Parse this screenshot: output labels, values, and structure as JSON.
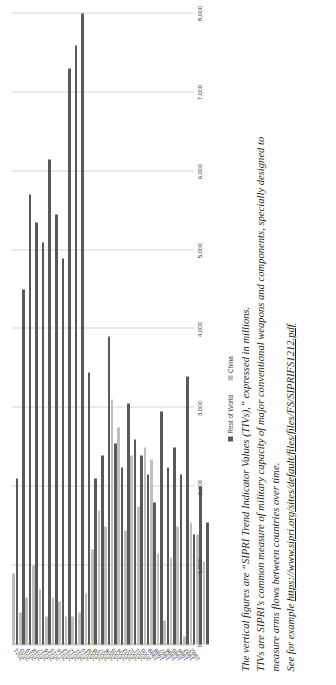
{
  "chart_data": {
    "type": "bar",
    "orientation": "horizontal",
    "title": "",
    "xlabel": "",
    "ylabel": "",
    "xlim": [
      0,
      8000
    ],
    "xticks": [
      "0",
      "1,000",
      "2,000",
      "3,000",
      "4,000",
      "5,000",
      "6,000",
      "7,000",
      "8,000"
    ],
    "xtick_values": [
      0,
      1000,
      2000,
      3000,
      4000,
      5000,
      6000,
      7000,
      8000
    ],
    "grid": true,
    "legend_position": "bottom-right",
    "categories": [
      "1992",
      "1993",
      "1994",
      "1995",
      "1996",
      "1997",
      "1998",
      "1999",
      "2000",
      "2001",
      "2002",
      "2003",
      "2004",
      "2005",
      "2006",
      "2007",
      "2008",
      "2009",
      "2010",
      "2011",
      "2012",
      "2013",
      "2014",
      "2015",
      "2016",
      "2017",
      "2018",
      "2019",
      "2020",
      "2021"
    ],
    "series": [
      {
        "name": "China",
        "color": "#bfbfbf",
        "values": [
          1050,
          1400,
          1550,
          100,
          1500,
          1100,
          300,
          1150,
          2350,
          2500,
          1750,
          2400,
          1450,
          2750,
          3100,
          1500,
          1700,
          1200,
          650,
          400,
          350,
          350,
          550,
          600,
          350,
          700,
          1000,
          600,
          400,
          900
        ]
      },
      {
        "name": "Rest of World",
        "color": "#595959",
        "values": [
          1550,
          2000,
          1400,
          3400,
          2150,
          2500,
          2250,
          2950,
          1800,
          2150,
          2400,
          2600,
          3050,
          2250,
          2550,
          3900,
          2400,
          2100,
          3450,
          8000,
          7600,
          7300,
          4900,
          5450,
          6150,
          5100,
          5350,
          5700,
          4500,
          2100
        ]
      }
    ]
  },
  "legend": {
    "items": [
      {
        "label": "Rest of World",
        "color": "#595959"
      },
      {
        "label": "China",
        "color": "#bfbfbf"
      }
    ]
  },
  "caption": {
    "line1": "The vertical figures are “SIPRI Trend Indicator Values (TIVs),” expressed in millions.",
    "line2": "TIVs are SIPRI’s common measure of military capacity of major conventional weapons and components, specially designed to",
    "line3": "measure arms flows between countries over time.",
    "line4_prefix": "See for example ",
    "line4_link": "https://www.sipri.org/sites/default/files/files/FS/SIPRIFS1212.pdf"
  }
}
